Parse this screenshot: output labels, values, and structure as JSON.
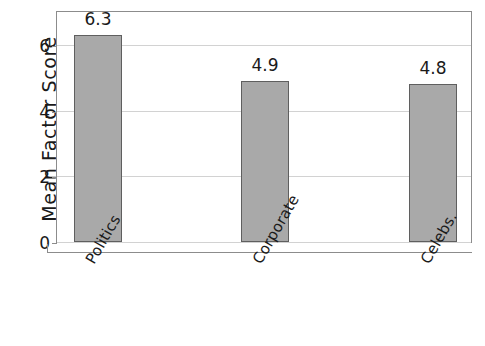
{
  "chart_data": {
    "type": "bar",
    "title": "",
    "xlabel": "",
    "ylabel": "Mean Factor Score",
    "categories": [
      "Politics",
      "Corporate",
      "Celebs."
    ],
    "values": [
      6.3,
      4.9,
      4.8
    ],
    "value_labels": [
      "6.3",
      "4.9",
      "4.8"
    ],
    "ylim": [
      0,
      7.0
    ],
    "yticks": [
      0,
      2,
      4,
      6
    ],
    "ytick_labels": [
      "0",
      "2",
      "4",
      "6"
    ],
    "grid": true,
    "legend": false,
    "colors": {
      "bar_fill": "#a9a9a9",
      "bar_edge": "#5f5f5f",
      "gridline": "#d2d2d2",
      "axis": "#8c8c8c",
      "text": "#1a1a1a",
      "background": "#ffffff"
    }
  }
}
